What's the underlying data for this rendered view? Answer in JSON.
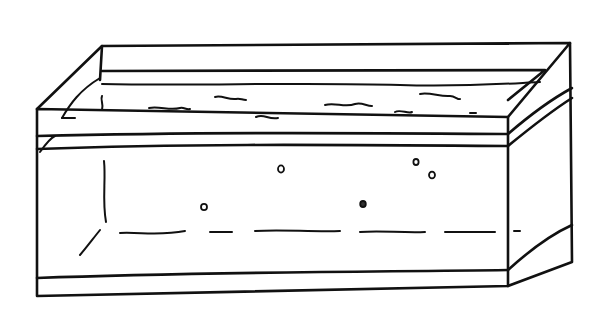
{
  "drawing": {
    "subject": "aquarium-tank",
    "style": "black ink line drawing on white",
    "colors": {
      "background": "#ffffff",
      "ink": "#111111"
    },
    "bubbles": [
      {
        "cx": 281,
        "cy": 169,
        "r": 3
      },
      {
        "cx": 204,
        "cy": 207,
        "r": 3
      },
      {
        "cx": 363,
        "cy": 204,
        "r": 3
      },
      {
        "cx": 416,
        "cy": 162,
        "r": 2.8
      },
      {
        "cx": 432,
        "cy": 175,
        "r": 3
      }
    ]
  }
}
